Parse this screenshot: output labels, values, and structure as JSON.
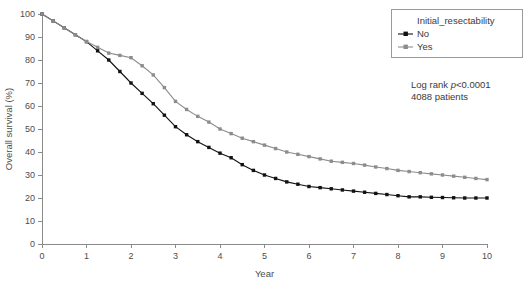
{
  "chart_data": {
    "type": "line",
    "title": "",
    "xlabel": "Year",
    "ylabel": "Overall survival (%)",
    "xlim": [
      0,
      10
    ],
    "ylim": [
      0,
      100
    ],
    "xticks": [
      "0",
      "1",
      "2",
      "3",
      "4",
      "5",
      "6",
      "7",
      "8",
      "9",
      "10"
    ],
    "yticks": [
      "0",
      "10",
      "20",
      "30",
      "40",
      "50",
      "60",
      "70",
      "80",
      "90",
      "100"
    ],
    "grid": false,
    "legend_position": "top-right",
    "legend_title": "Initial_resectability",
    "series": [
      {
        "name": "No",
        "color": "#111111",
        "marker": "square",
        "x": [
          0,
          0.25,
          0.5,
          0.75,
          1,
          1.25,
          1.5,
          1.75,
          2,
          2.25,
          2.5,
          2.75,
          3,
          3.25,
          3.5,
          3.75,
          4,
          4.25,
          4.5,
          4.75,
          5,
          5.25,
          5.5,
          5.75,
          6,
          6.25,
          6.5,
          6.75,
          7,
          7.25,
          7.5,
          7.75,
          8,
          8.25,
          8.5,
          8.75,
          9,
          9.25,
          9.5,
          9.75,
          10
        ],
        "values": [
          100,
          97,
          94,
          91,
          88,
          84,
          80,
          75,
          70,
          65.5,
          61,
          56,
          51,
          47.5,
          44.5,
          42,
          39.5,
          37.5,
          34.5,
          32,
          30,
          28.5,
          27,
          26,
          25,
          24.5,
          24,
          23.5,
          23,
          22.5,
          22,
          21.5,
          21,
          20.5,
          20.5,
          20.3,
          20.2,
          20.1,
          20,
          20,
          20
        ]
      },
      {
        "name": "Yes",
        "color": "#8c8c8c",
        "marker": "square",
        "x": [
          0,
          0.25,
          0.5,
          0.75,
          1,
          1.25,
          1.5,
          1.75,
          2,
          2.25,
          2.5,
          2.75,
          3,
          3.25,
          3.5,
          3.75,
          4,
          4.25,
          4.5,
          4.75,
          5,
          5.25,
          5.5,
          5.75,
          6,
          6.25,
          6.5,
          6.75,
          7,
          7.25,
          7.5,
          7.75,
          8,
          8.25,
          8.5,
          8.75,
          9,
          9.25,
          9.5,
          9.75,
          10
        ],
        "values": [
          100,
          97,
          94,
          91,
          88,
          85.5,
          83,
          82,
          81,
          77.5,
          73.5,
          68,
          62,
          58.5,
          55.5,
          53,
          50,
          48,
          46,
          44.5,
          43,
          41.5,
          40,
          39,
          38,
          37,
          36,
          35.5,
          35,
          34.3,
          33.5,
          32.8,
          32,
          31.5,
          31,
          30.5,
          30,
          29.5,
          29,
          28.5,
          28
        ]
      }
    ],
    "annotations": [
      {
        "text_prefix": "Log rank ",
        "text_italic": "p",
        "text_suffix": "<0.0001"
      },
      {
        "text": "4088 patients"
      }
    ]
  }
}
